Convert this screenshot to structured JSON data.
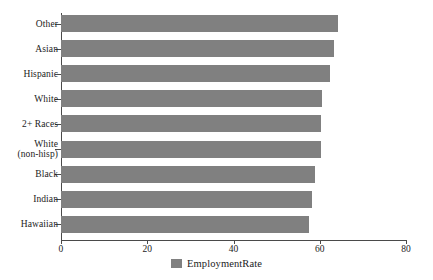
{
  "chart_data": {
    "type": "bar",
    "orientation": "horizontal",
    "title": "",
    "subtitle": "",
    "xlabel": "",
    "ylabel": "",
    "xlim": [
      0,
      80
    ],
    "xticks": [
      0,
      20,
      40,
      60,
      80
    ],
    "xtick_labels": [
      "0",
      "20",
      "40",
      "60",
      "80"
    ],
    "grid": false,
    "legend": {
      "position": "bottom-center",
      "entries": [
        {
          "name": "EmploymentRate",
          "color": "#808080"
        }
      ]
    },
    "categories": [
      "Other",
      "Asian",
      "Hispanic",
      "White",
      "2+ Races",
      "White\n(non-hisp)",
      "Black",
      "Indian",
      "Hawaiian"
    ],
    "series": [
      {
        "name": "EmploymentRate",
        "color": "#808080",
        "values": [
          64.2,
          63.4,
          62.3,
          60.6,
          60.4,
          60.2,
          59.0,
          58.1,
          57.6
        ]
      }
    ]
  },
  "colors": {
    "bar": "#808080",
    "axis": "#4a4a4a",
    "text": "#1b1b1b",
    "background": "#ffffff"
  }
}
